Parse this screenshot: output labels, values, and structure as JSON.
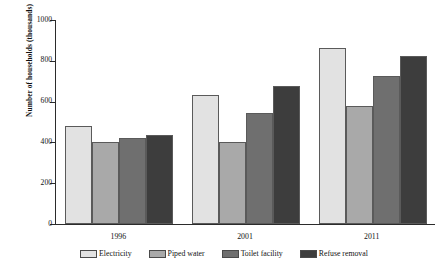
{
  "chart_data": {
    "type": "bar",
    "title": "",
    "subtitle": "",
    "xlabel": "",
    "ylabel": "Number of households (thousands)",
    "categories": [
      "1996",
      "2001",
      "2011"
    ],
    "series": [
      {
        "name": "Electricity",
        "color": "#e2e2e2",
        "values": [
          480,
          630,
          865
        ]
      },
      {
        "name": "Piped water",
        "color": "#a9a9a9",
        "values": [
          400,
          400,
          580
        ]
      },
      {
        "name": "Toilet facility",
        "color": "#6f6f6f",
        "values": [
          420,
          545,
          725
        ]
      },
      {
        "name": "Refuse removal",
        "color": "#3d3d3d",
        "values": [
          435,
          675,
          825
        ]
      }
    ],
    "ylim": [
      0,
      1000
    ],
    "ytick_values": [
      0,
      200,
      400,
      600,
      800,
      1000
    ],
    "ytick_labels": [
      "0",
      "200",
      "400",
      "600",
      "800",
      "1000"
    ],
    "grid": false,
    "legend_position": "bottom",
    "annotations": []
  },
  "legend": {
    "items": [
      {
        "label": "Electricity"
      },
      {
        "label": "Piped water"
      },
      {
        "label": "Toilet facility"
      },
      {
        "label": "Refuse removal"
      }
    ]
  }
}
